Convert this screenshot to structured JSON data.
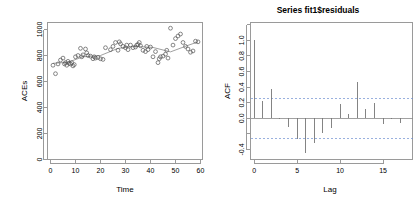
{
  "figure": {
    "background": "#ffffff",
    "panel_count": 2
  },
  "chart_data": [
    {
      "type": "scatter",
      "panel": "left",
      "title": "",
      "xlabel": "Time",
      "ylabel": "ACEs",
      "xlim": [
        0,
        62
      ],
      "ylim": [
        0,
        1050
      ],
      "xticks": [
        0,
        10,
        20,
        30,
        40,
        50,
        60
      ],
      "xticklabels": [
        "0",
        "10",
        "20",
        "30",
        "40",
        "50",
        "60"
      ],
      "yticks": [
        0,
        200,
        400,
        600,
        800,
        1000
      ],
      "yticklabels": [
        "0",
        "200",
        "400",
        "600",
        "800",
        "1000"
      ],
      "grid": false,
      "legend": "none",
      "marker": "open-circle",
      "marker_color": "#555555",
      "x": [
        1,
        2,
        3,
        4,
        5,
        5.6,
        6,
        6.5,
        7,
        7.4,
        8,
        8.5,
        9,
        9.5,
        10,
        11,
        12,
        12.5,
        13,
        14,
        14.5,
        15,
        16,
        17,
        17.5,
        18,
        19,
        20,
        21,
        22,
        24,
        25,
        26,
        27,
        27.5,
        28,
        29,
        30,
        30.5,
        31,
        32,
        33,
        34,
        34.5,
        35,
        35.5,
        36,
        37,
        38,
        38.5,
        39,
        40,
        41,
        42,
        43,
        43.5,
        44,
        45,
        46,
        46.5,
        47,
        48,
        49,
        50,
        51,
        52,
        53,
        54,
        55,
        56,
        57,
        58,
        59
      ],
      "y": [
        725,
        660,
        735,
        765,
        780,
        735,
        745,
        725,
        755,
        740,
        735,
        745,
        720,
        730,
        790,
        800,
        855,
        790,
        805,
        850,
        820,
        800,
        795,
        775,
        790,
        780,
        785,
        775,
        770,
        860,
        845,
        870,
        900,
        840,
        905,
        890,
        870,
        860,
        880,
        845,
        880,
        860,
        865,
        880,
        885,
        900,
        875,
        840,
        830,
        870,
        845,
        865,
        790,
        830,
        745,
        775,
        790,
        795,
        810,
        840,
        780,
        1010,
        880,
        930,
        950,
        965,
        900,
        870,
        850,
        825,
        835,
        910,
        905
      ],
      "trend_line": {
        "type": "lowess",
        "color": "#777777",
        "x": [
          1,
          7,
          13,
          20,
          27,
          34,
          41,
          48,
          55,
          59
        ],
        "y": [
          740,
          748,
          790,
          800,
          855,
          870,
          862,
          828,
          878,
          905
        ]
      }
    },
    {
      "type": "bar",
      "subtype": "acf",
      "panel": "right",
      "title": "Series  fit1$residuals",
      "xlabel": "Lag",
      "ylabel": "ACF",
      "xlim": [
        -0.4,
        17.6
      ],
      "ylim": [
        -0.52,
        1.04
      ],
      "xticks": [
        0,
        5,
        10,
        15
      ],
      "xticklabels": [
        "0",
        "5",
        "10",
        "15"
      ],
      "yticks": [
        -0.4,
        -0.2,
        0.0,
        0.2,
        0.4,
        0.6,
        0.8,
        1.0
      ],
      "yticklabels": [
        "-0.4",
        "",
        "0.0",
        "0.2",
        "0.4",
        "0.6",
        "0.8",
        "1.0"
      ],
      "grid": false,
      "legend": "none",
      "bar_color": "#777777",
      "categories": [
        0,
        1,
        2,
        3,
        4,
        5,
        6,
        7,
        8,
        9,
        10,
        11,
        12,
        13,
        14,
        15,
        16,
        17
      ],
      "values": [
        1.0,
        0.22,
        0.37,
        -0.005,
        -0.11,
        -0.27,
        -0.45,
        -0.32,
        -0.19,
        -0.12,
        0.18,
        0.06,
        0.47,
        0.12,
        0.2,
        -0.07,
        -0.015,
        -0.06
      ],
      "confidence_bounds": {
        "upper": 0.26,
        "lower": -0.26,
        "color": "#6d8fd0",
        "style": "dashed"
      }
    }
  ]
}
